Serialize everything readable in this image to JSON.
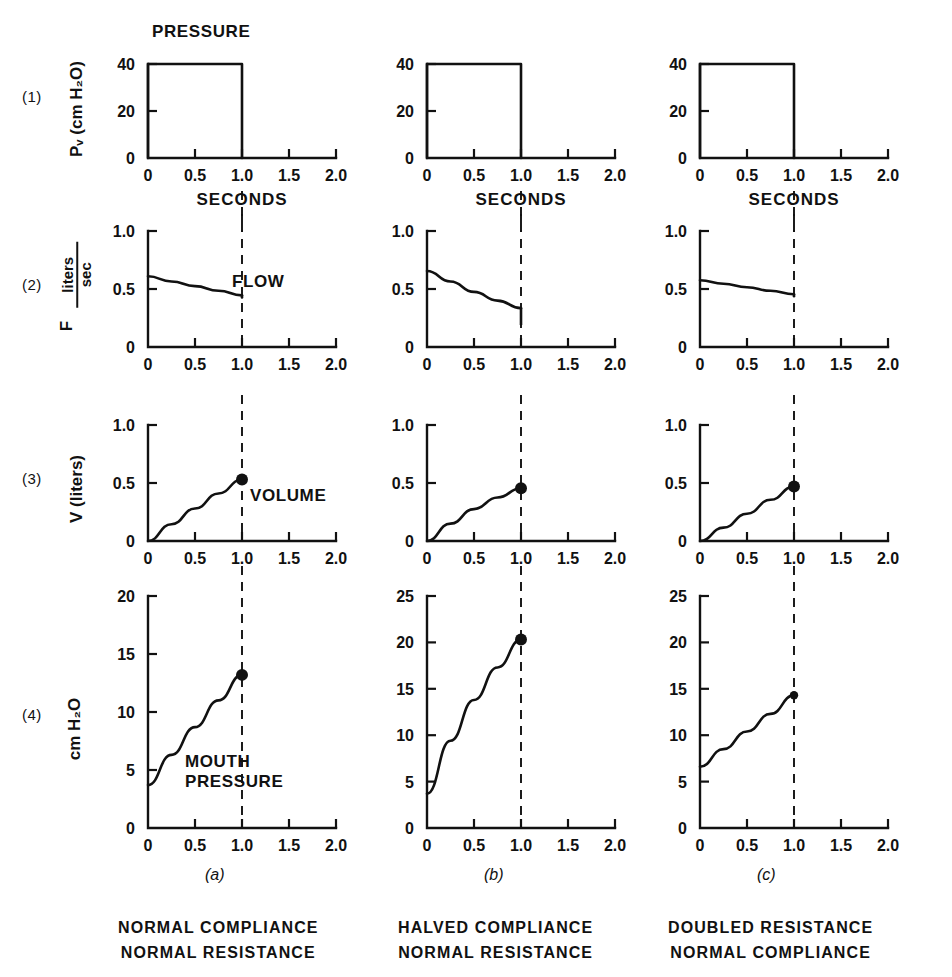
{
  "figure": {
    "rows": [
      {
        "id": "1",
        "label": "(1)",
        "ylabel": "Pᵥ (cm H₂O)"
      },
      {
        "id": "2",
        "label": "(2)",
        "ylabel_var": "F",
        "ylabel_num": "liters",
        "ylabel_den": "sec"
      },
      {
        "id": "3",
        "label": "(3)",
        "ylabel": "V (liters)"
      },
      {
        "id": "4",
        "label": "(4)",
        "ylabel": "cm H₂O"
      }
    ],
    "columns": [
      {
        "key": "a",
        "caption": "(a)",
        "line1": "NORMAL COMPLIANCE",
        "line2": "NORMAL RESISTANCE"
      },
      {
        "key": "b",
        "caption": "(b)",
        "line1": "HALVED COMPLIANCE",
        "line2": "NORMAL RESISTANCE"
      },
      {
        "key": "c",
        "caption": "(c)",
        "line1": "DOUBLED RESISTANCE",
        "line2": "NORMAL COMPLIANCE"
      }
    ],
    "annotations": {
      "pressure": "PRESSURE",
      "flow": "FLOW",
      "volume": "VOLUME",
      "mouth_pressure_line1": "MOUTH",
      "mouth_pressure_line2": "PRESSURE",
      "seconds": "SECONDS"
    },
    "colors": {
      "ink": "#111111",
      "background": "#ffffff"
    }
  },
  "chart_data": [
    {
      "type": "line",
      "id": "row1-col-a",
      "title": "PRESSURE",
      "row": "(1)",
      "column": "(a)",
      "xlabel": "SECONDS",
      "ylabel": "Pv (cm H2O)",
      "xlim": [
        0,
        2.0
      ],
      "ylim": [
        0,
        40
      ],
      "xticks": [
        0,
        0.5,
        1.0,
        1.5,
        2.0
      ],
      "xticklabels": [
        "0",
        "0.5",
        "1.0",
        "1.5",
        "2.0"
      ],
      "yticks": [
        0,
        20,
        40
      ],
      "yticklabels": [
        "0",
        "20",
        "40"
      ],
      "grid": false,
      "legend": "none",
      "series": [
        {
          "name": "Pv",
          "x": [
            0,
            0,
            1.0,
            1.0
          ],
          "y": [
            0,
            40,
            40,
            0
          ]
        }
      ]
    },
    {
      "type": "line",
      "id": "row1-col-b",
      "row": "(1)",
      "column": "(b)",
      "xlabel": "SECONDS",
      "xlim": [
        0,
        2.0
      ],
      "ylim": [
        0,
        40
      ],
      "xticks": [
        0,
        0.5,
        1.0,
        1.5,
        2.0
      ],
      "xticklabels": [
        "0",
        "0.5",
        "1.0",
        "1.5",
        "2.0"
      ],
      "yticks": [
        0,
        20,
        40
      ],
      "yticklabels": [
        "0",
        "20",
        "40"
      ],
      "grid": false,
      "series": [
        {
          "name": "Pv",
          "x": [
            0,
            0,
            1.0,
            1.0
          ],
          "y": [
            0,
            40,
            40,
            0
          ]
        }
      ]
    },
    {
      "type": "line",
      "id": "row1-col-c",
      "row": "(1)",
      "column": "(c)",
      "xlabel": "SECONDS",
      "xlim": [
        0,
        2.0
      ],
      "ylim": [
        0,
        40
      ],
      "xticks": [
        0,
        0.5,
        1.0,
        1.5,
        2.0
      ],
      "xticklabels": [
        "0",
        "0.5",
        "1.0",
        "1.5",
        "2.0"
      ],
      "yticks": [
        0,
        20,
        40
      ],
      "yticklabels": [
        "0",
        "20",
        "40"
      ],
      "grid": false,
      "series": [
        {
          "name": "Pv",
          "x": [
            0,
            0,
            1.0,
            1.0
          ],
          "y": [
            0,
            40,
            40,
            0
          ]
        }
      ]
    },
    {
      "type": "line",
      "id": "row2-col-a",
      "title": "FLOW",
      "row": "(2)",
      "column": "(a)",
      "ylabel": "F liters/sec",
      "xlim": [
        0,
        2.0
      ],
      "ylim": [
        0,
        1.0
      ],
      "xticks": [
        0,
        0.5,
        1.0,
        1.5,
        2.0
      ],
      "xticklabels": [
        "0",
        "0.5",
        "1.0",
        "1.5",
        "2.0"
      ],
      "yticks": [
        0,
        0.5,
        1.0
      ],
      "yticklabels": [
        "0",
        "0.5",
        "1.0"
      ],
      "grid": false,
      "series": [
        {
          "name": "Flow",
          "x": [
            0,
            0.25,
            0.5,
            0.75,
            1.0
          ],
          "y": [
            0.61,
            0.565,
            0.525,
            0.485,
            0.445
          ]
        }
      ]
    },
    {
      "type": "line",
      "id": "row2-col-b",
      "row": "(2)",
      "column": "(b)",
      "xlim": [
        0,
        2.0
      ],
      "ylim": [
        0,
        1.0
      ],
      "xticks": [
        0,
        0.5,
        1.0,
        1.5,
        2.0
      ],
      "xticklabels": [
        "0",
        "0.5",
        "1.0",
        "1.5",
        "2.0"
      ],
      "yticks": [
        0,
        0.5,
        1.0
      ],
      "yticklabels": [
        "0",
        "0.5",
        "1.0"
      ],
      "grid": false,
      "series": [
        {
          "name": "Flow",
          "x": [
            0,
            0.25,
            0.5,
            0.75,
            1.0
          ],
          "y": [
            0.655,
            0.565,
            0.475,
            0.4,
            0.335
          ]
        }
      ]
    },
    {
      "type": "line",
      "id": "row2-col-c",
      "row": "(2)",
      "column": "(c)",
      "xlim": [
        0,
        2.0
      ],
      "ylim": [
        0,
        1.0
      ],
      "xticks": [
        0,
        0.5,
        1.0,
        1.5,
        2.0
      ],
      "xticklabels": [
        "0",
        "0.5",
        "1.0",
        "1.5",
        "2.0"
      ],
      "yticks": [
        0,
        0.5,
        1.0
      ],
      "yticklabels": [
        "0",
        "0.5",
        "1.0"
      ],
      "grid": false,
      "series": [
        {
          "name": "Flow",
          "x": [
            0,
            0.25,
            0.5,
            0.75,
            1.0
          ],
          "y": [
            0.575,
            0.545,
            0.515,
            0.485,
            0.455
          ]
        }
      ]
    },
    {
      "type": "line",
      "id": "row3-col-a",
      "title": "VOLUME",
      "row": "(3)",
      "column": "(a)",
      "ylabel": "V (liters)",
      "xlim": [
        0,
        2.0
      ],
      "ylim": [
        0,
        1.0
      ],
      "xticks": [
        0,
        0.5,
        1.0,
        1.5,
        2.0
      ],
      "xticklabels": [
        "0",
        "0.5",
        "1.0",
        "1.5",
        "2.0"
      ],
      "yticks": [
        0,
        0.5,
        1.0
      ],
      "yticklabels": [
        "0",
        "0.5",
        "1.0"
      ],
      "grid": false,
      "endpoint_marker": true,
      "endpoint": {
        "x": 1.0,
        "y": 0.53
      },
      "series": [
        {
          "name": "Volume",
          "x": [
            0,
            0.25,
            0.5,
            0.75,
            1.0
          ],
          "y": [
            0,
            0.145,
            0.28,
            0.41,
            0.53
          ]
        }
      ]
    },
    {
      "type": "line",
      "id": "row3-col-b",
      "row": "(3)",
      "column": "(b)",
      "xlim": [
        0,
        2.0
      ],
      "ylim": [
        0,
        1.0
      ],
      "xticks": [
        0,
        0.5,
        1.0,
        1.5,
        2.0
      ],
      "xticklabels": [
        "0",
        "0.5",
        "1.0",
        "1.5",
        "2.0"
      ],
      "yticks": [
        0,
        0.5,
        1.0
      ],
      "yticklabels": [
        "0",
        "0.5",
        "1.0"
      ],
      "grid": false,
      "endpoint_marker": true,
      "endpoint": {
        "x": 1.0,
        "y": 0.455
      },
      "series": [
        {
          "name": "Volume",
          "x": [
            0,
            0.25,
            0.5,
            0.75,
            1.0
          ],
          "y": [
            0,
            0.15,
            0.275,
            0.375,
            0.455
          ]
        }
      ]
    },
    {
      "type": "line",
      "id": "row3-col-c",
      "row": "(3)",
      "column": "(c)",
      "xlim": [
        0,
        2.0
      ],
      "ylim": [
        0,
        1.0
      ],
      "xticks": [
        0,
        0.5,
        1.0,
        1.5,
        2.0
      ],
      "xticklabels": [
        "0",
        "0.5",
        "1.0",
        "1.5",
        "2.0"
      ],
      "yticks": [
        0,
        0.5,
        1.0
      ],
      "yticklabels": [
        "0",
        "0.5",
        "1.0"
      ],
      "grid": false,
      "endpoint_marker": true,
      "endpoint": {
        "x": 1.0,
        "y": 0.47
      },
      "series": [
        {
          "name": "Volume",
          "x": [
            0,
            0.25,
            0.5,
            0.75,
            1.0
          ],
          "y": [
            0,
            0.115,
            0.235,
            0.355,
            0.47
          ]
        }
      ]
    },
    {
      "type": "line",
      "id": "row4-col-a",
      "title": "MOUTH PRESSURE",
      "row": "(4)",
      "column": "(a)",
      "ylabel": "cm H2O",
      "xlim": [
        0,
        2.0
      ],
      "ylim": [
        0,
        20
      ],
      "xticks": [
        0,
        0.5,
        1.0,
        1.5,
        2.0
      ],
      "xticklabels": [
        "0",
        "0.5",
        "1.0",
        "1.5",
        "2.0"
      ],
      "yticks": [
        0,
        5,
        10,
        15,
        20
      ],
      "yticklabels": [
        "0",
        "5",
        "10",
        "15",
        "20"
      ],
      "grid": false,
      "endpoint_marker": true,
      "endpoint": {
        "x": 1.0,
        "y": 13.2
      },
      "series": [
        {
          "name": "Mouth pressure",
          "x": [
            0,
            0.25,
            0.5,
            0.75,
            1.0
          ],
          "y": [
            3.7,
            6.3,
            8.7,
            11.0,
            13.2
          ]
        }
      ]
    },
    {
      "type": "line",
      "id": "row4-col-b",
      "row": "(4)",
      "column": "(b)",
      "xlim": [
        0,
        2.0
      ],
      "ylim": [
        0,
        25
      ],
      "xticks": [
        0,
        0.5,
        1.0,
        1.5,
        2.0
      ],
      "xticklabels": [
        "0",
        "0.5",
        "1.0",
        "1.5",
        "2.0"
      ],
      "yticks": [
        0,
        5,
        10,
        15,
        20,
        25
      ],
      "yticklabels": [
        "0",
        "5",
        "10",
        "15",
        "20",
        "25"
      ],
      "grid": false,
      "endpoint_marker": true,
      "endpoint": {
        "x": 1.0,
        "y": 20.3
      },
      "series": [
        {
          "name": "Mouth pressure",
          "x": [
            0,
            0.25,
            0.5,
            0.75,
            1.0
          ],
          "y": [
            3.7,
            9.4,
            13.8,
            17.3,
            20.3
          ]
        }
      ]
    },
    {
      "type": "line",
      "id": "row4-col-c",
      "row": "(4)",
      "column": "(c)",
      "xlim": [
        0,
        2.0
      ],
      "ylim": [
        0,
        25
      ],
      "xticks": [
        0,
        0.5,
        1.0,
        1.5,
        2.0
      ],
      "xticklabels": [
        "0",
        "0.5",
        "1.0",
        "1.5",
        "2.0"
      ],
      "yticks": [
        0,
        5,
        10,
        15,
        20,
        25
      ],
      "yticklabels": [
        "0",
        "5",
        "10",
        "15",
        "20",
        "25"
      ],
      "grid": false,
      "endpoint_marker": true,
      "endpoint": {
        "x": 1.0,
        "y": 14.3
      },
      "series": [
        {
          "name": "Mouth pressure",
          "x": [
            0,
            0.25,
            0.5,
            0.75,
            1.0
          ],
          "y": [
            6.6,
            8.5,
            10.4,
            12.3,
            14.3
          ]
        }
      ]
    }
  ]
}
